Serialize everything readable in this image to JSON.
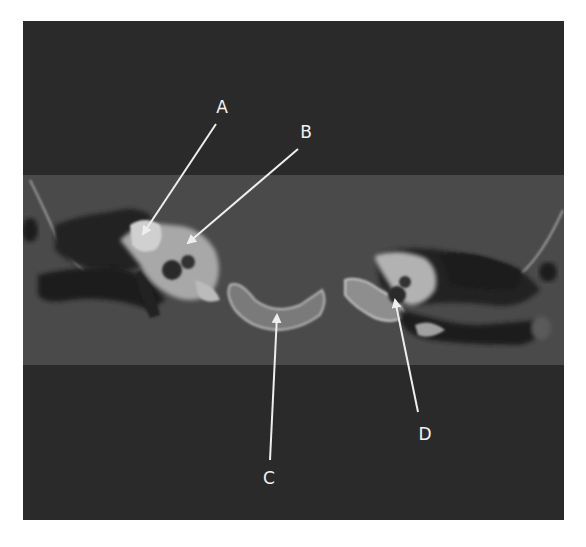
{
  "figure": {
    "type": "axial CT scan of temporal bones",
    "colors": {
      "background": "#ffffff",
      "outer_field": "#2a2a2a",
      "tissue_band": "#4a4a4a",
      "bone": "#c9c9c9",
      "air": "#1c1c1c",
      "arrow": "#eeeeee"
    }
  },
  "labels": [
    {
      "id": "A",
      "text": "A",
      "x": 222,
      "y": 107
    },
    {
      "id": "B",
      "text": "B",
      "x": 306,
      "y": 132
    },
    {
      "id": "C",
      "text": "C",
      "x": 269,
      "y": 478
    },
    {
      "id": "D",
      "text": "D",
      "x": 425,
      "y": 434
    }
  ],
  "arrows": [
    {
      "id": "A",
      "from": [
        216,
        124
      ],
      "to": [
        143,
        234
      ]
    },
    {
      "id": "B",
      "from": [
        298,
        149
      ],
      "to": [
        188,
        243
      ]
    },
    {
      "id": "C",
      "from": [
        270,
        460
      ],
      "to": [
        277,
        315
      ]
    },
    {
      "id": "D",
      "from": [
        418,
        412
      ],
      "to": [
        395,
        300
      ]
    }
  ]
}
